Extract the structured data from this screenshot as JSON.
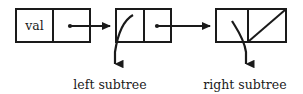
{
  "diagram": {
    "colors": {
      "stroke": "#1a1a1a",
      "fill": "#ffffff",
      "background": "#ffffff"
    },
    "nodes": [
      {
        "id": "node-1",
        "value_label": "val",
        "left_cell": "val",
        "right_cell": "",
        "has_pointer_out": true,
        "has_null_slash": false,
        "has_subtree_arrow": false
      },
      {
        "id": "node-2",
        "value_label": "",
        "left_cell": "",
        "right_cell": "",
        "has_pointer_out": true,
        "has_null_slash": false,
        "has_subtree_arrow": true,
        "subtree_caption": "left subtree"
      },
      {
        "id": "node-3",
        "value_label": "",
        "left_cell": "",
        "right_cell": "",
        "has_pointer_out": false,
        "has_null_slash": true,
        "has_subtree_arrow": true,
        "subtree_caption": "right subtree"
      }
    ],
    "captions": {
      "left": "left subtree",
      "right": "right subtree"
    }
  }
}
